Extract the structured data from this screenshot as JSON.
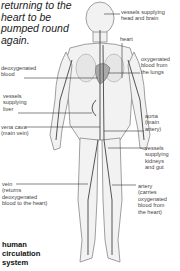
{
  "intro_text": "returning to the heart to be pumped round again.",
  "title": [
    "human",
    "circulation",
    "system"
  ],
  "labels": {
    "head_vessels": [
      "vessels supplying",
      "head and brain"
    ],
    "heart": "heart",
    "oxygenated_lungs": [
      "oxygenated",
      "blood from",
      "the lungs"
    ],
    "deoxygenated": [
      "deoxygenated",
      "blood"
    ],
    "liver_vessels": [
      "vessels",
      "supplying",
      "liver"
    ],
    "vena_cava": [
      "vena cava",
      "(main vein)"
    ],
    "aorta": [
      "aorta",
      "(main",
      "artery)"
    ],
    "kidney_vessels": [
      "vessels",
      "supplying",
      "kidneys",
      "and gut"
    ],
    "vein": [
      "vein",
      "(returns",
      "deoxygenated",
      "blood to the heart)"
    ],
    "artery": [
      "artery",
      "(carries",
      "oxygenated",
      "blood from",
      "the heart)"
    ]
  }
}
